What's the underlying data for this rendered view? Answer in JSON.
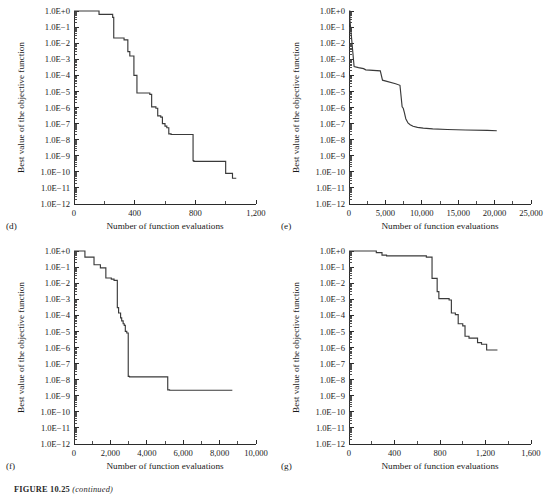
{
  "figure": {
    "caption_label": "FIGURE 10.25",
    "caption_note": "(continued)"
  },
  "common": {
    "ylabel": "Best value of the objective function",
    "xlabel": "Number of function evaluations",
    "yticks": [
      "1.0E+0",
      "1.0E−1",
      "1.0E−2",
      "1.0E−3",
      "1.0E−4",
      "1.0E−5",
      "1.0E−6",
      "1.0E−7",
      "1.0E−8",
      "1.0E−9",
      "1.0E−10",
      "1.0E−11",
      "1.0E−12"
    ],
    "line_color": "#3a3a3a",
    "axis_color": "#2b2b2b"
  },
  "chart_data": [
    {
      "type": "line",
      "panel": "(d)",
      "title": "",
      "xlabel": "Number of function evaluations",
      "ylabel": "Best value of the objective function",
      "yscale": "log",
      "ylim": [
        1e-12,
        1
      ],
      "xlim": [
        0,
        1200
      ],
      "grid": false,
      "legend": "none",
      "xticks": [
        0,
        400,
        800,
        1200
      ],
      "xtick_labels": [
        "0",
        "400",
        "800",
        "1,200"
      ],
      "ytick_labels": [
        "1.0E+0",
        "1.0E−1",
        "1.0E−2",
        "1.0E−3",
        "1.0E−4",
        "1.0E−5",
        "1.0E−6",
        "1.0E−7",
        "1.0E−8",
        "1.0E−9",
        "1.0E−10",
        "1.0E−11",
        "1.0E−12"
      ],
      "series": [
        {
          "name": "best objective value",
          "x": [
            0,
            165,
            165,
            255,
            255,
            262,
            262,
            330,
            330,
            355,
            355,
            368,
            368,
            395,
            395,
            415,
            415,
            500,
            500,
            512,
            512,
            540,
            540,
            552,
            552,
            572,
            572,
            583,
            583,
            600,
            600,
            612,
            612,
            625,
            625,
            640,
            640,
            785,
            785,
            790,
            790,
            1000,
            1000,
            1045,
            1045,
            1070
          ],
          "y": [
            1.0,
            1.0,
            0.62,
            0.62,
            0.4,
            0.4,
            0.021,
            0.021,
            0.016,
            0.016,
            0.003,
            0.003,
            0.0016,
            0.0016,
            0.0001,
            0.0001,
            8e-06,
            8e-06,
            6.5e-06,
            6.5e-06,
            1.1e-06,
            1.1e-06,
            9e-07,
            9e-07,
            3e-07,
            3e-07,
            2.5e-07,
            2.5e-07,
            1e-07,
            1e-07,
            7e-08,
            7e-08,
            5.5e-08,
            5.5e-08,
            2.3e-08,
            2.3e-08,
            2.1e-08,
            2.1e-08,
            5e-10,
            5e-10,
            4.5e-10,
            4.5e-10,
            8e-11,
            8e-11,
            4e-11,
            4e-11
          ]
        }
      ]
    },
    {
      "type": "line",
      "panel": "(e)",
      "title": "",
      "xlabel": "Number of function evaluations",
      "ylabel": "Best value of the objective function",
      "yscale": "log",
      "ylim": [
        1e-12,
        1
      ],
      "xlim": [
        0,
        25000
      ],
      "grid": false,
      "legend": "none",
      "xticks": [
        0,
        5000,
        10000,
        15000,
        20000,
        25000
      ],
      "xtick_labels": [
        "0",
        "5,000",
        "10,000",
        "15,000",
        "20,000",
        "25,000"
      ],
      "ytick_labels": [
        "1.0E+0",
        "1.0E−1",
        "1.0E−2",
        "1.0E−3",
        "1.0E−4",
        "1.0E−5",
        "1.0E−6",
        "1.0E−7",
        "1.0E−8",
        "1.0E−9",
        "1.0E−10",
        "1.0E−11",
        "1.0E−12"
      ],
      "series": [
        {
          "name": "best objective value",
          "x": [
            0,
            120,
            120,
            700,
            700,
            1300,
            1300,
            2000,
            2000,
            2300,
            2300,
            4300,
            4300,
            4600,
            4600,
            6400,
            6400,
            7000,
            7000,
            7300,
            7300,
            7450,
            7450,
            7600,
            7600,
            7800,
            7800,
            8100,
            8400,
            8800,
            9400,
            10200,
            11500,
            13500,
            16000,
            19000,
            20300
          ],
          "y": [
            1.0,
            1.0,
            0.3,
            0.00035,
            0.00035,
            0.0003,
            0.0003,
            0.00026,
            0.00026,
            0.00022,
            0.00022,
            0.00019,
            0.00019,
            5e-05,
            5e-05,
            3e-05,
            3e-05,
            2.4e-05,
            2.4e-05,
            1.1e-06,
            1.1e-06,
            9e-07,
            9e-07,
            5e-07,
            5e-07,
            2e-07,
            2e-07,
            1.1e-07,
            8.5e-08,
            6.8e-08,
            5.8e-08,
            5.2e-08,
            4.7e-08,
            4.3e-08,
            4e-08,
            3.8e-08,
            3.6e-08
          ]
        }
      ]
    },
    {
      "type": "line",
      "panel": "(f)",
      "title": "",
      "xlabel": "Number of function evaluations",
      "ylabel": "Best value of the objective function",
      "yscale": "log",
      "ylim": [
        1e-12,
        1
      ],
      "xlim": [
        0,
        10000
      ],
      "grid": false,
      "legend": "none",
      "xticks": [
        0,
        2000,
        4000,
        6000,
        8000,
        10000
      ],
      "xtick_labels": [
        "0",
        "2,000",
        "4,000",
        "6,000",
        "8,000",
        "10,000"
      ],
      "ytick_labels": [
        "1.0E+0",
        "1.0E−1",
        "1.0E−2",
        "1.0E−3",
        "1.0E−4",
        "1.0E−5",
        "1.0E−6",
        "1.0E−7",
        "1.0E−8",
        "1.0E−9",
        "1.0E−10",
        "1.0E−11",
        "1.0E−12"
      ],
      "series": [
        {
          "name": "best objective value",
          "x": [
            0,
            600,
            600,
            1100,
            1100,
            1450,
            1450,
            1750,
            1750,
            2050,
            2050,
            2200,
            2200,
            2380,
            2380,
            2450,
            2450,
            2560,
            2560,
            2620,
            2620,
            2700,
            2700,
            2760,
            2760,
            2820,
            2820,
            2900,
            2900,
            2980,
            2980,
            3050,
            3050,
            5150,
            5150,
            5250,
            5250,
            8700
          ],
          "y": [
            1.0,
            1.0,
            0.42,
            0.42,
            0.14,
            0.14,
            0.09,
            0.09,
            0.021,
            0.021,
            0.018,
            0.018,
            0.015,
            0.015,
            0.0003,
            0.0003,
            0.00014,
            0.00014,
            7e-05,
            7e-05,
            4.5e-05,
            4.5e-05,
            3e-05,
            3e-05,
            2.4e-05,
            2.4e-05,
            1e-05,
            1e-05,
            8e-06,
            8e-06,
            1.6e-08,
            1.6e-08,
            1.5e-08,
            1.5e-08,
            2.3e-09,
            2.3e-09,
            2.2e-09,
            2.2e-09
          ]
        }
      ]
    },
    {
      "type": "line",
      "panel": "(g)",
      "title": "",
      "xlabel": "Number of function evaluations",
      "ylabel": "Best value of the objective function",
      "yscale": "log",
      "ylim": [
        1e-12,
        1
      ],
      "xlim": [
        0,
        1600
      ],
      "grid": false,
      "legend": "none",
      "xticks": [
        0,
        400,
        800,
        1200,
        1600
      ],
      "xtick_labels": [
        "0",
        "400",
        "800",
        "1,200",
        "1,600"
      ],
      "ytick_labels": [
        "1.0E+0",
        "1.0E−1",
        "1.0E−2",
        "1.0E−3",
        "1.0E−4",
        "1.0E−5",
        "1.0E−6",
        "1.0E−7",
        "1.0E−8",
        "1.0E−9",
        "1.0E−10",
        "1.0E−11",
        "1.0E−12"
      ],
      "series": [
        {
          "name": "best objective value",
          "x": [
            0,
            240,
            240,
            290,
            290,
            330,
            330,
            680,
            680,
            730,
            730,
            775,
            775,
            790,
            790,
            880,
            880,
            900,
            900,
            935,
            935,
            960,
            960,
            1000,
            1000,
            1020,
            1020,
            1055,
            1055,
            1130,
            1130,
            1165,
            1165,
            1210,
            1210,
            1305
          ],
          "y": [
            1.0,
            1.0,
            0.8,
            0.8,
            0.55,
            0.55,
            0.5,
            0.5,
            0.42,
            0.42,
            0.02,
            0.02,
            0.003,
            0.003,
            0.0011,
            0.0011,
            0.0009,
            0.0009,
            0.00014,
            0.00014,
            0.00011,
            0.00011,
            3e-05,
            3e-05,
            2.2e-05,
            2.2e-05,
            5e-06,
            5e-06,
            3.8e-06,
            3.8e-06,
            2e-06,
            2e-06,
            1.6e-06,
            1.6e-06,
            7e-07,
            7e-07
          ]
        }
      ]
    }
  ]
}
